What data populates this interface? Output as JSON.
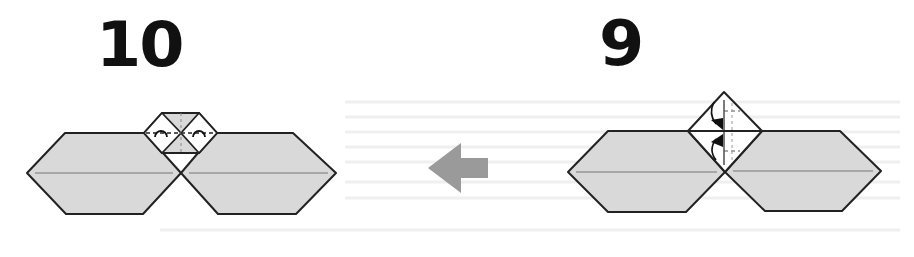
{
  "steps": [
    {
      "number": "10",
      "description": "Result after squash folds: two hexagons joined with small square, two inside-reverse folds marked"
    },
    {
      "number": "9",
      "description": "Diamond flap above two joined hexagons with valley fold arrows toward center"
    }
  ],
  "arrow": {
    "direction": "left",
    "icon": "arrow-left-icon",
    "color": "#9a9a9a"
  },
  "colors": {
    "paper_fill": "#d9d9d9",
    "paper_white": "#ffffff",
    "outline": "#222222",
    "crease": "#777777",
    "number": "#111111",
    "bleed_text": "#ececec"
  }
}
